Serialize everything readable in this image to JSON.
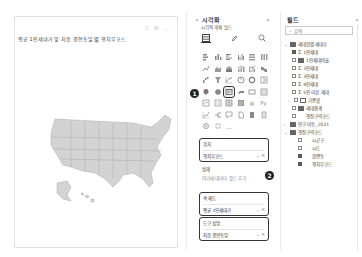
{
  "canvas": {
    "visual_title": "평균 1인세대가 및 처음 결연동일 별 행치부코드",
    "visual_tools": "▽ ⊡ …",
    "map": {
      "type": "filled-map",
      "region": "United States",
      "fill_color": "#d3d3d3",
      "border_color": "#a8a8a8"
    }
  },
  "side_strip": {
    "label": "필터"
  },
  "visualizations": {
    "title": "시각화",
    "collapse_left": "«",
    "expand_right": "»",
    "subtitle": "시각적 개체 빌드",
    "modes": [
      {
        "name": "fields-mode-icon",
        "glyph": "▤"
      },
      {
        "name": "format-mode-icon",
        "glyph": "🖌"
      },
      {
        "name": "analytics-mode-icon",
        "glyph": "🔍"
      }
    ],
    "badge_1": "1",
    "badge_2": "2",
    "wells": {
      "location": {
        "label": "위치",
        "field": "행치부코드",
        "controls": "⌄ ✕"
      },
      "legend": {
        "label": "범례",
        "placeholder": "여기에 데이터 필드 추가"
      },
      "tooltip": {
        "label": "색 채도",
        "field": "평균 1인세대가",
        "controls": "⌄ ✕"
      },
      "drill": {
        "label": "도구 설명",
        "field": "처음 결연동일",
        "controls": "⌄ ✕"
      }
    }
  },
  "fields": {
    "title": "필드",
    "expand": "»",
    "search_placeholder": "검색",
    "tree": [
      {
        "level": 0,
        "arrow": "⌄",
        "type": "table",
        "label": "세대원별 세대수"
      },
      {
        "level": 1,
        "checked": true,
        "type": "sigma",
        "label": "1인세대"
      },
      {
        "level": 1,
        "checked": false,
        "type": "table",
        "label": "1인세대비율"
      },
      {
        "level": 1,
        "checked": false,
        "type": "sigma",
        "label": "2인세대"
      },
      {
        "level": 1,
        "checked": false,
        "type": "sigma",
        "label": "3인세대"
      },
      {
        "level": 1,
        "checked": false,
        "type": "sigma",
        "label": "4인세대"
      },
      {
        "level": 1,
        "checked": false,
        "type": "sigma",
        "label": "5인 이상 세대"
      },
      {
        "level": 1,
        "arrow": "›",
        "checked": false,
        "type": "calendar",
        "label": "기준월"
      },
      {
        "level": 1,
        "checked": false,
        "type": "table",
        "label": "세대합계"
      },
      {
        "level": 1,
        "checked": false,
        "type": "none",
        "label": "행정구역코드"
      },
      {
        "level": 0,
        "arrow": "›",
        "type": "table",
        "label": "인구 이동_2021"
      },
      {
        "level": 0,
        "arrow": "⌄",
        "type": "table",
        "label": "행정구역코드"
      },
      {
        "level": 1,
        "checked": false,
        "type": "none",
        "label": "시군구"
      },
      {
        "level": 1,
        "checked": false,
        "type": "none",
        "label": "시도"
      },
      {
        "level": 1,
        "checked": true,
        "type": "none",
        "label": "읍면동"
      },
      {
        "level": 1,
        "checked": true,
        "type": "none",
        "label": "행치부코드"
      }
    ]
  }
}
